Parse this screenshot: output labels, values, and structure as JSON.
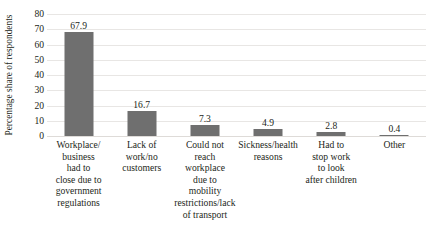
{
  "chart_data": {
    "type": "bar",
    "title": "",
    "subtitle": "",
    "xlabel": "",
    "ylabel": "Percentage share of respondents",
    "ylim": [
      0,
      80
    ],
    "yticks": [
      80,
      70,
      60,
      50,
      40,
      30,
      20,
      10,
      0
    ],
    "ytick_labels": [
      "80",
      "70",
      "60",
      "50",
      "40",
      "30",
      "20",
      "10",
      "0"
    ],
    "grid": true,
    "legend": false,
    "legend_position": "none",
    "bar_color": "#6f6f6f",
    "gridline_color": "#e8e6e4",
    "categories": [
      "Workplace/ business had to close due to government regulations",
      "Lack of work/no customers",
      "Could not reach workplace due to mobility restrictions/lack of transport",
      "Sickness/health reasons",
      "Had to stop work to look after children",
      "Other"
    ],
    "category_lines": [
      [
        "Workplace/",
        "business",
        "had to",
        "close due to",
        "government",
        "regulations"
      ],
      [
        "Lack of",
        "work/no",
        "customers"
      ],
      [
        "Could not",
        "reach",
        "workplace",
        "due to",
        "mobility",
        "restrictions/lack",
        "of transport"
      ],
      [
        "Sickness/health",
        "reasons"
      ],
      [
        "Had to",
        "stop work",
        "to look",
        "after children"
      ],
      [
        "Other"
      ]
    ],
    "values": [
      67.9,
      16.7,
      7.3,
      4.9,
      2.8,
      0.4
    ],
    "value_labels": [
      "67.9",
      "16.7",
      "7.3",
      "4.9",
      "2.8",
      "0.4"
    ]
  }
}
